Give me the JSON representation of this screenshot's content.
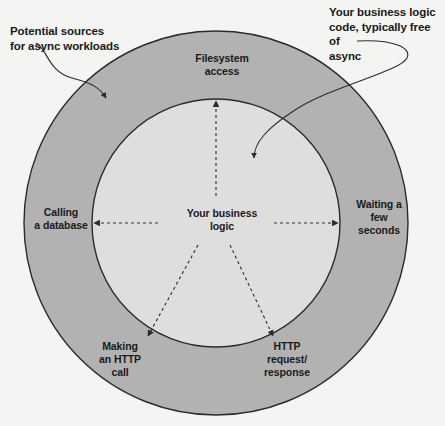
{
  "figure": {
    "width": 445,
    "height": 426,
    "background_color": "#f4f4f3"
  },
  "colors": {
    "page_background": "#f4f4f3",
    "outer_ring_fill": "#b2b2b2",
    "inner_disc_fill": "#dedede",
    "stroke": "#2b2b2b",
    "text": "#1a1a1a"
  },
  "geometry": {
    "center_x": 216,
    "center_y": 223,
    "outer_radius": 192,
    "inner_radius": 124
  },
  "callouts": [
    {
      "id": "potential-sources",
      "text": "Potential sources\nfor async workloads",
      "arrow_target": "outer ring, upper-left"
    },
    {
      "id": "business-logic-code",
      "text": "Your business logic\ncode, typically free of\nasync",
      "arrow_target": "inner disc, upper-right"
    }
  ],
  "ring_labels": [
    {
      "id": "filesystem-access",
      "text": "Filesystem\naccess",
      "position": "top"
    },
    {
      "id": "calling-a-database",
      "text": "Calling\na database",
      "position": "left"
    },
    {
      "id": "waiting-a-few-seconds",
      "text": "Waiting a\nfew\nseconds",
      "position": "right"
    },
    {
      "id": "making-an-http-call",
      "text": "Making\nan HTTP\ncall",
      "position": "bottom-left"
    },
    {
      "id": "http-request-response",
      "text": "HTTP\nrequest/\nresponse",
      "position": "bottom-right"
    }
  ],
  "center": {
    "label": "Your business\nlogic"
  },
  "connectors": [
    {
      "id": "connector-filesystem-access",
      "style": "dashed",
      "arrowhead": "end",
      "direction": "up"
    },
    {
      "id": "connector-calling-a-database",
      "style": "dashed",
      "arrowhead": "end",
      "direction": "left"
    },
    {
      "id": "connector-waiting-a-few-seconds",
      "style": "dashed",
      "arrowhead": "end",
      "direction": "right"
    },
    {
      "id": "connector-making-an-http-call",
      "style": "dashed",
      "arrowhead": "end",
      "direction": "down-left"
    },
    {
      "id": "connector-http-request-response",
      "style": "dashed",
      "arrowhead": "end",
      "direction": "down-right"
    }
  ]
}
